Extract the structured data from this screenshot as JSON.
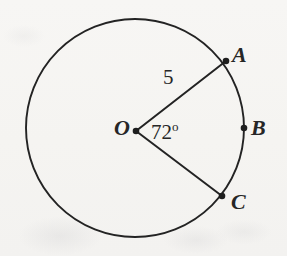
{
  "figure": {
    "kind": "circle-central-angle-diagram",
    "background_color": "#f6f5f3",
    "stroke_color": "#232323",
    "labels": {
      "point_a": "A",
      "point_b": "B",
      "point_c": "C",
      "center_o": "O",
      "angle_value": "72",
      "angle_unit": "o",
      "radius_value": "5"
    },
    "geometry": {
      "circle": {
        "cx": 135,
        "cy": 128,
        "r": 109,
        "stroke_width": 1.8
      },
      "points": [
        {
          "name": "A",
          "x": 226,
          "y": 61
        },
        {
          "name": "B",
          "x": 244,
          "y": 128
        },
        {
          "name": "C",
          "x": 222,
          "y": 196
        },
        {
          "name": "O",
          "x": 136,
          "y": 131
        }
      ],
      "radii": [
        {
          "from": "O",
          "to": "A"
        },
        {
          "from": "O",
          "to": "C"
        }
      ]
    }
  }
}
